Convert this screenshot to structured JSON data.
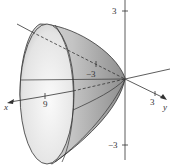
{
  "figure": {
    "axes": {
      "x": {
        "label": "x",
        "tick": "9"
      },
      "y": {
        "label": "y",
        "tick_pos": "3",
        "tick_neg": "−3"
      },
      "z": {
        "tick_pos": "3",
        "tick_neg": "−3"
      }
    },
    "colors": {
      "surface_light": "#f2f2f2",
      "surface_dark": "#9a9a9a",
      "line": "#333333"
    }
  }
}
